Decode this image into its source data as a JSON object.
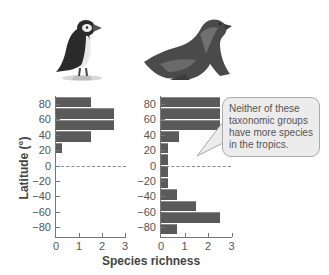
{
  "figure": {
    "y_axis_title": "Latitude (°)",
    "x_axis_title": "Species richness",
    "y_tick_labels": [
      "80",
      "60",
      "40",
      "20",
      "0",
      "−20",
      "−40",
      "−60",
      "−80"
    ],
    "x_tick_labels": [
      "0",
      "1",
      "2",
      "3"
    ],
    "callout_text": "Neither of these taxonomic groups have more species in the tropics.",
    "panels": [
      {
        "name": "puffin",
        "image": "puffin-illustration"
      },
      {
        "name": "sea lion",
        "image": "sea-lion-illustration"
      }
    ]
  },
  "chart_data": [
    {
      "type": "bar",
      "orientation": "horizontal",
      "panel": "left (puffin)",
      "title": "",
      "xlabel": "Species richness",
      "ylabel": "Latitude (°)",
      "categories": [
        "90 to 75",
        "75 to 60",
        "60 to 45",
        "45 to 30",
        "30 to 15",
        "15 to 0",
        "0 to -15",
        "-15 to -30",
        "-30 to -45",
        "-45 to -60",
        "-60 to -75",
        "-75 to -90"
      ],
      "values": [
        1.5,
        2.5,
        2.5,
        1.5,
        0.25,
        0,
        0,
        0,
        0,
        0,
        0,
        0
      ],
      "xlim": [
        0,
        3
      ],
      "ylim": [
        -90,
        90
      ],
      "y_ticks": [
        80,
        60,
        40,
        20,
        0,
        -20,
        -40,
        -60,
        -80
      ],
      "x_ticks": [
        0,
        1,
        2,
        3
      ],
      "reference_line": {
        "y": 0,
        "style": "dashed"
      },
      "grid": false
    },
    {
      "type": "bar",
      "orientation": "horizontal",
      "panel": "right (sea lion)",
      "title": "",
      "xlabel": "Species richness",
      "ylabel": "Latitude (°)",
      "categories": [
        "90 to 75",
        "75 to 60",
        "60 to 45",
        "45 to 30",
        "30 to 15",
        "15 to 0",
        "0 to -15",
        "-15 to -30",
        "-30 to -45",
        "-45 to -60",
        "-60 to -75",
        "-75 to -90"
      ],
      "values": [
        2.5,
        2.5,
        2.5,
        0.75,
        0.3,
        0.3,
        0.3,
        0.3,
        0.7,
        1.5,
        2.5,
        0.7
      ],
      "xlim": [
        0,
        3
      ],
      "ylim": [
        -90,
        90
      ],
      "y_ticks": [
        80,
        60,
        40,
        20,
        0,
        -20,
        -40,
        -60,
        -80
      ],
      "x_ticks": [
        0,
        1,
        2,
        3
      ],
      "reference_line": {
        "y": 0,
        "style": "dashed"
      },
      "annotation": "Neither of these taxonomic groups have more species in the tropics.",
      "grid": false
    }
  ]
}
